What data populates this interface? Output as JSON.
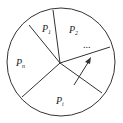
{
  "diagram": {
    "type": "spinner-wheel",
    "sectors": [
      {
        "label": "P",
        "subscript": "1"
      },
      {
        "label": "P",
        "subscript": "2"
      },
      {
        "label": "P",
        "subscript": "i"
      },
      {
        "label": "P",
        "subscript": "n"
      }
    ],
    "ellipsis": "...",
    "has_arrow": true,
    "stroke_color": "#333333"
  }
}
